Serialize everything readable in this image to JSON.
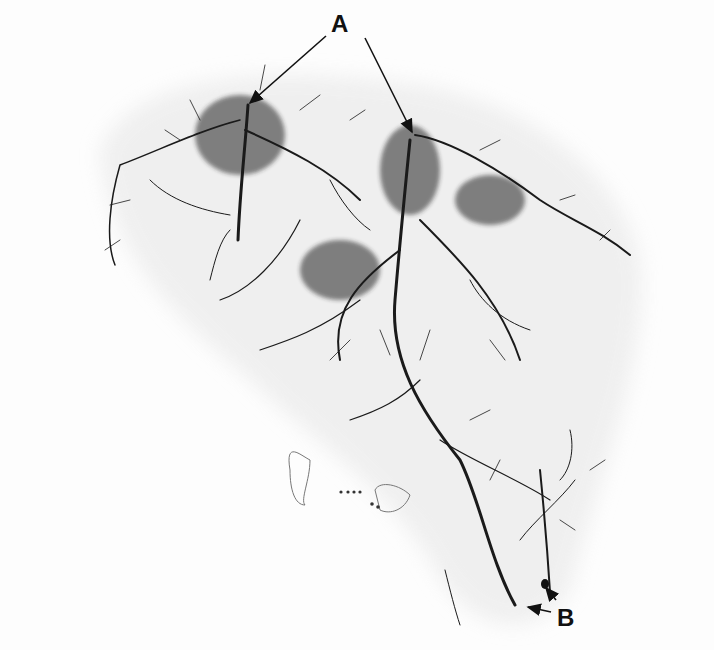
{
  "figure": {
    "labels": [
      {
        "id": "A",
        "text": "A",
        "x": 333,
        "y": 38,
        "arrow_targets": [
          [
            248,
            102
          ],
          [
            413,
            132
          ]
        ]
      },
      {
        "id": "B",
        "text": "B",
        "x": 556,
        "y": 620,
        "arrow_targets": [
          [
            527,
            610
          ],
          [
            547,
            590
          ]
        ]
      }
    ],
    "colors": {
      "background": "#fdfdfd",
      "tissue_haze": "#ececec",
      "process": "#1a1a1a",
      "label": "#111111"
    }
  }
}
